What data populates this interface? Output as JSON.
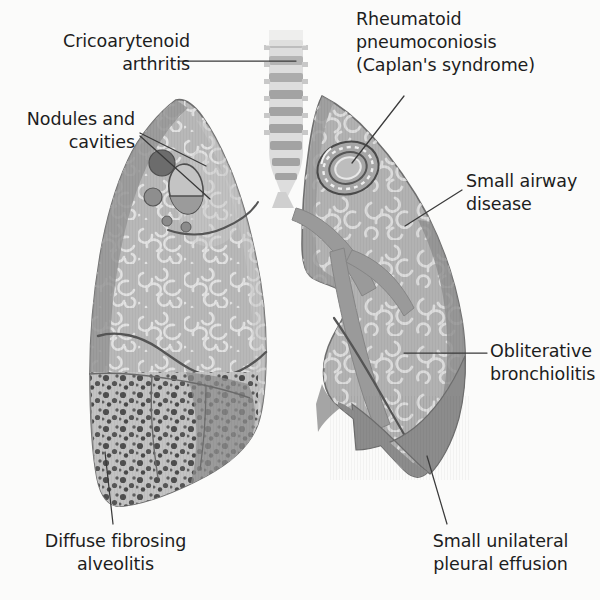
{
  "figure": {
    "background_color": "#fbfbfa"
  },
  "palette": {
    "lung_fill": "#b5b5b5",
    "lung_fill_light": "#c4c4c4",
    "lung_rim_dark": "#8e8e8e",
    "lung_edge_line": "#5a5a5a",
    "markings": "#dedede",
    "trachea_light": "#dcdcdc",
    "trachea_ring": "#9d9d9d",
    "nodule_dark": "#6c6c6c",
    "nodule_mid": "#8b8b8b",
    "cavity_outline": "#555555",
    "fibrosis_fill": "#c0c0c0",
    "fibrosis_dots": "#4a4a4a",
    "effusion": "#8a8a8a",
    "bronchus": "#9a9a9a",
    "leader_line": "#3a3a3a",
    "text": "#1d1d1d"
  },
  "labels": [
    {
      "id": "cricoarytenoid-arthritis",
      "text": "Cricoarytenoid\narthritis",
      "align": "right",
      "x": 20,
      "y": 30,
      "width": 170
    },
    {
      "id": "nodules-and-cavities",
      "text": "Nodules and\ncavities",
      "align": "right",
      "x": 10,
      "y": 108,
      "width": 125
    },
    {
      "id": "rheumatoid-pneumoconiosis",
      "text": "Rheumatoid\npneumoconiosis\n(Caplan's syndrome)",
      "align": "left",
      "x": 356,
      "y": 8,
      "width": 230
    },
    {
      "id": "small-airway-disease",
      "text": "Small airway\ndisease",
      "align": "left",
      "x": 466,
      "y": 170,
      "width": 125
    },
    {
      "id": "obliterative-bronchiolitis",
      "text": "Obliterative\nbronchiolitis",
      "align": "left",
      "x": 490,
      "y": 340,
      "width": 125
    },
    {
      "id": "diffuse-fibrosing-alveolitis",
      "text": "Diffuse fibrosing\nalveolitis",
      "align": "center",
      "x": 28,
      "y": 530,
      "width": 175
    },
    {
      "id": "small-unilateral-pleural-effusion",
      "text": "Small unilateral\npleural effusion",
      "align": "center",
      "x": 418,
      "y": 530,
      "width": 165
    }
  ],
  "leader_lines": [
    {
      "id": "leader-cricoarytenoid",
      "from": [
        178,
        61
      ],
      "to": [
        296,
        61
      ]
    },
    {
      "id": "leader-nodules-a",
      "from": [
        140,
        133
      ],
      "to": [
        205,
        165
      ]
    },
    {
      "id": "leader-nodules-b",
      "from": [
        140,
        135
      ],
      "to": [
        209,
        198
      ]
    },
    {
      "id": "leader-caplan",
      "from": [
        404,
        96
      ],
      "to": [
        352,
        163
      ]
    },
    {
      "id": "leader-small-airway",
      "from": [
        462,
        190
      ],
      "to": [
        405,
        226
      ]
    },
    {
      "id": "leader-obliterative",
      "from": [
        486,
        353
      ],
      "to": [
        406,
        353
      ]
    },
    {
      "id": "leader-fibrosing",
      "from": [
        113,
        522
      ],
      "to": [
        105,
        455
      ]
    },
    {
      "id": "leader-effusion",
      "from": [
        447,
        522
      ],
      "to": [
        427,
        458
      ]
    }
  ],
  "anatomy": {
    "trachea": {
      "name": "trachea",
      "rings": 9,
      "x": 268,
      "top": 30,
      "bottom": 185,
      "width": 34
    },
    "left_lung_on_image": {
      "name": "patient-right-lung",
      "apex": [
        176,
        100
      ],
      "base_y": 505
    },
    "right_lung_on_image": {
      "name": "patient-left-lung",
      "apex": [
        322,
        96
      ],
      "base_y": 500
    },
    "nodules": [
      {
        "id": "nodule-large",
        "cx": 162,
        "cy": 163,
        "r": 13,
        "style": "solid-dark"
      },
      {
        "id": "nodule-medium",
        "cx": 153,
        "cy": 197,
        "r": 9,
        "style": "solid-mid"
      },
      {
        "id": "nodule-small-1",
        "cx": 167,
        "cy": 221,
        "r": 5,
        "style": "solid-mid"
      },
      {
        "id": "nodule-small-2",
        "cx": 186,
        "cy": 227,
        "r": 5,
        "style": "solid-mid"
      }
    ],
    "cavities": [
      {
        "id": "cavity-large",
        "cx": 186,
        "cy": 189,
        "rx": 17,
        "ry": 25,
        "fluid_level_y": 196
      }
    ],
    "caplan_nodule": {
      "id": "caplan-ring-nodule",
      "cx": 348,
      "cy": 168,
      "rings": 4,
      "rx": 30,
      "ry": 25
    },
    "fibrosis_zone": {
      "id": "diffuse-fibrosing-alveolitis-zone",
      "dot_count": 190
    },
    "pleural_effusion": {
      "id": "pleural-effusion-wedge",
      "side": "patient-left"
    },
    "bronchial_tree": {
      "id": "bronchial-tree",
      "branches": 3
    }
  }
}
